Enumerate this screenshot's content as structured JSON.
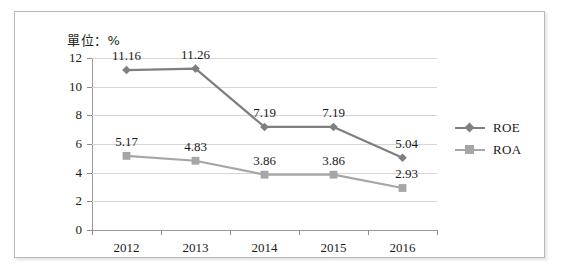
{
  "unit_note": "單位：%",
  "chart_data": {
    "type": "line",
    "title": "",
    "subtitle": "",
    "xlabel": "",
    "ylabel": "",
    "unit": "%",
    "categories": [
      "2012",
      "2013",
      "2014",
      "2015",
      "2016"
    ],
    "series": [
      {
        "name": "ROE",
        "color": "#7f7f7f",
        "marker": "diamond",
        "values": [
          11.16,
          11.26,
          7.19,
          7.19,
          5.04
        ],
        "labels": [
          "11.16",
          "11.26",
          "7.19",
          "7.19",
          "5.04"
        ]
      },
      {
        "name": "ROA",
        "color": "#a6a6a6",
        "marker": "square",
        "values": [
          5.17,
          4.83,
          3.86,
          3.86,
          2.93
        ],
        "labels": [
          "5.17",
          "4.83",
          "3.86",
          "3.86",
          "2.93"
        ]
      }
    ],
    "ylim": [
      0,
      12
    ],
    "yticks": [
      0,
      2,
      4,
      6,
      8,
      10,
      12
    ],
    "ytick_labels": [
      "0",
      "2",
      "4",
      "6",
      "8",
      "10",
      "12"
    ],
    "grid": true,
    "grid_axis": "y",
    "legend_position": "right",
    "legend_entries": [
      "ROE",
      "ROA"
    ]
  },
  "colors": {
    "roe": "#7f7f7f",
    "roa": "#a6a6a6",
    "grid": "#d6d6d6",
    "axis": "#9a9a9a",
    "text": "#1a1a1a",
    "frame_border": "#b9b9b9"
  }
}
